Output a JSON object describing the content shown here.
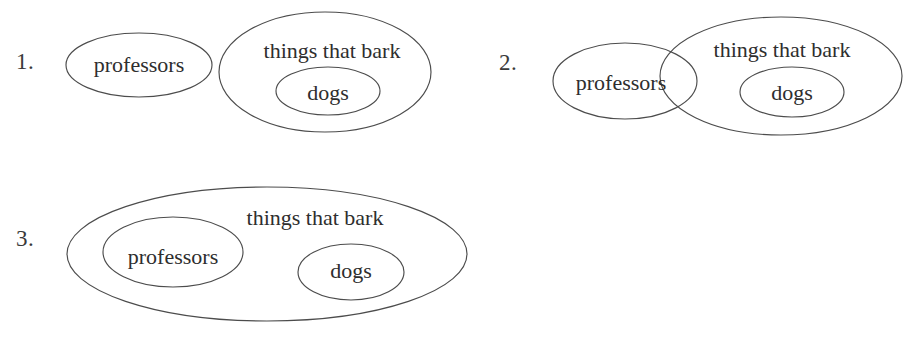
{
  "page": {
    "background_color": "#ffffff",
    "ink_color": "#4c4c4c",
    "text_color": "#2e2e2e",
    "width": 918,
    "height": 342
  },
  "diagrams": [
    {
      "number": "1.",
      "number_name": "diagram-1-number",
      "relation": "disjoint",
      "sets": [
        {
          "name": "professors",
          "label": "professors",
          "shape": "ellipse",
          "cx": 139,
          "cy": 65,
          "rx": 73,
          "ry": 32,
          "label_x": 139,
          "label_y": 65
        },
        {
          "name": "things-that-bark",
          "label": "things that bark",
          "shape": "ellipse",
          "cx": 325,
          "cy": 72,
          "rx": 106,
          "ry": 60,
          "label_x": 332,
          "label_y": 51
        },
        {
          "name": "dogs",
          "label": "dogs",
          "shape": "ellipse",
          "cx": 328,
          "cy": 91,
          "rx": 52,
          "ry": 24,
          "label_x": 328,
          "label_y": 91
        }
      ]
    },
    {
      "number": "2.",
      "number_name": "diagram-2-number",
      "relation": "overlapping",
      "sets": [
        {
          "name": "professors",
          "label": "professors",
          "shape": "ellipse",
          "cx": 625,
          "cy": 81,
          "rx": 72,
          "ry": 38,
          "label_x": 621,
          "label_y": 83
        },
        {
          "name": "things-that-bark",
          "label": "things that bark",
          "shape": "ellipse",
          "cx": 781,
          "cy": 76,
          "rx": 121,
          "ry": 59,
          "label_x": 782,
          "label_y": 50
        },
        {
          "name": "dogs",
          "label": "dogs",
          "shape": "ellipse",
          "cx": 792,
          "cy": 92,
          "rx": 52,
          "ry": 25,
          "label_x": 792,
          "label_y": 92
        }
      ]
    },
    {
      "number": "3.",
      "number_name": "diagram-3-number",
      "relation": "nested",
      "sets": [
        {
          "name": "things-that-bark",
          "label": "things that bark",
          "shape": "ellipse",
          "cx": 267,
          "cy": 254,
          "rx": 200,
          "ry": 67,
          "label_x": 315,
          "label_y": 218
        },
        {
          "name": "professors",
          "label": "professors",
          "shape": "ellipse",
          "cx": 173,
          "cy": 252,
          "rx": 70,
          "ry": 35,
          "label_x": 173,
          "label_y": 256
        },
        {
          "name": "dogs",
          "label": "dogs",
          "shape": "ellipse",
          "cx": 351,
          "cy": 272,
          "rx": 53,
          "ry": 28,
          "label_x": 351,
          "label_y": 270
        }
      ]
    }
  ],
  "numbers": {
    "one": {
      "text": "1.",
      "x": 16,
      "y": 50
    },
    "two": {
      "text": "2.",
      "x": 499,
      "y": 51
    },
    "three": {
      "text": "3.",
      "x": 16,
      "y": 227
    }
  },
  "labels": {
    "d1_professors": {
      "text": "professors",
      "x": 139,
      "y": 65
    },
    "d1_bark": {
      "text": "things that bark",
      "x": 332,
      "y": 51
    },
    "d1_dogs": {
      "text": "dogs",
      "x": 328,
      "y": 93
    },
    "d2_professors": {
      "text": "professors",
      "x": 621,
      "y": 83
    },
    "d2_bark": {
      "text": "things that bark",
      "x": 782,
      "y": 50
    },
    "d2_dogs": {
      "text": "dogs",
      "x": 792,
      "y": 93
    },
    "d3_bark": {
      "text": "things that bark",
      "x": 315,
      "y": 218
    },
    "d3_professors": {
      "text": "professors",
      "x": 173,
      "y": 257
    },
    "d3_dogs": {
      "text": "dogs",
      "x": 351,
      "y": 271
    }
  }
}
